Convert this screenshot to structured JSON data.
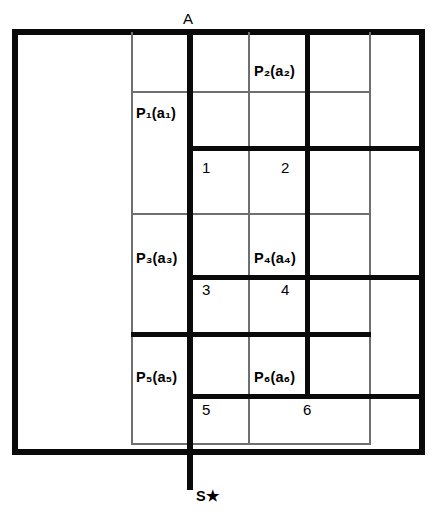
{
  "figure": {
    "title": "",
    "colors": {
      "stroke_heavy": "#0a0a0a",
      "stroke_light": "#6f6f6f",
      "background": "#ffffff"
    },
    "nodes": {
      "top": {
        "label": "A",
        "name": "node-a"
      },
      "bottom": {
        "label": "S★",
        "name": "node-s"
      }
    },
    "process_labels": [
      {
        "id": "p1",
        "text": "P₁(a₁)",
        "base": "P",
        "sub": "1",
        "arg": "(a₁)"
      },
      {
        "id": "p2",
        "text": "P₂(a₂)",
        "base": "P",
        "sub": "2",
        "arg": "(a₂)"
      },
      {
        "id": "p3",
        "text": "P₃(a₃)",
        "base": "P",
        "sub": "3",
        "arg": "(a₃)"
      },
      {
        "id": "p4",
        "text": "P₄(a₄)",
        "base": "P",
        "sub": "4",
        "arg": "(a₄)"
      },
      {
        "id": "p5",
        "text": "P₅(a₅)",
        "base": "P",
        "sub": "5",
        "arg": "(a₅)"
      },
      {
        "id": "p6",
        "text": "P₆(a₆)",
        "base": "P",
        "sub": "6",
        "arg": "(a₆)"
      }
    ],
    "cell_numbers": [
      {
        "id": "c1",
        "text": "1"
      },
      {
        "id": "c2",
        "text": "2"
      },
      {
        "id": "c3",
        "text": "3"
      },
      {
        "id": "c4",
        "text": "4"
      },
      {
        "id": "c5",
        "text": "5"
      },
      {
        "id": "c6",
        "text": "6"
      }
    ]
  }
}
